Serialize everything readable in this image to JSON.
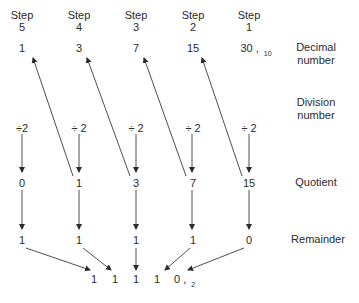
{
  "steps": [
    {
      "label": "Step",
      "num": "5",
      "decimal": "1",
      "divisor": "÷2",
      "quotient": "0",
      "remainder": "1"
    },
    {
      "label": "Step",
      "num": "4",
      "decimal": "3",
      "divisor": "÷ 2",
      "quotient": "1",
      "remainder": "1"
    },
    {
      "label": "Step",
      "num": "3",
      "decimal": "7",
      "divisor": "÷ 2",
      "quotient": "3",
      "remainder": "1"
    },
    {
      "label": "Step",
      "num": "2",
      "decimal": "15",
      "divisor": "÷ 2",
      "quotient": "7",
      "remainder": "1"
    },
    {
      "label": "Step",
      "num": "1",
      "decimal": "30",
      "divisor": "÷ 2",
      "quotient": "15",
      "remainder": "0"
    }
  ],
  "decimal_suffix": ",",
  "decimal_base": "10",
  "row_labels": {
    "decimal": [
      "Decimal",
      "number"
    ],
    "division": [
      "Division",
      "number"
    ],
    "quotient": "Quotient",
    "remainder": "Remainder"
  },
  "result": {
    "digits": [
      "1",
      "1",
      "1",
      "1",
      "0"
    ],
    "suffix": ",",
    "base": "2"
  },
  "colors": {
    "ink": "#2a2a2a",
    "line": "#3a3a3a",
    "background": "#ffffff"
  }
}
